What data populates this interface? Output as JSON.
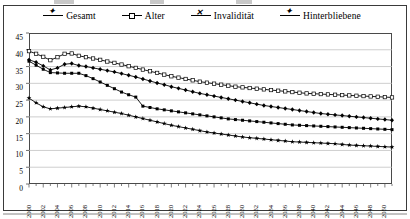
{
  "figure": {
    "frame": true,
    "background": "#ffffff",
    "line_color": "#000000"
  },
  "legend": {
    "position": "top-center",
    "items": [
      {
        "label": "Gesamt",
        "marker": "filled-diamond",
        "marker_class": "star"
      },
      {
        "label": "Alter",
        "marker": "hollow-square",
        "marker_class": "hollow"
      },
      {
        "label": "Invalidität",
        "marker": "filled-square",
        "marker_class": "cross"
      },
      {
        "label": "Hinterbliebene",
        "marker": "filled-star",
        "marker_class": "star"
      }
    ]
  },
  "axes": {
    "y_ticks": [
      "45",
      "40",
      "35",
      "30",
      "25",
      "20",
      "15",
      "10",
      "5",
      "0"
    ],
    "x_tick_step_years": 2,
    "grid": "horizontal"
  },
  "chart_data": {
    "type": "line",
    "title": "",
    "xlabel": "",
    "ylabel": "",
    "ylim": [
      0,
      45
    ],
    "xlim": [
      2000,
      2051
    ],
    "grid": true,
    "legend_position": "top-center",
    "x": [
      2000,
      2001,
      2002,
      2003,
      2004,
      2005,
      2006,
      2007,
      2008,
      2009,
      2010,
      2011,
      2012,
      2013,
      2014,
      2015,
      2016,
      2017,
      2018,
      2019,
      2020,
      2021,
      2022,
      2023,
      2024,
      2025,
      2026,
      2027,
      2028,
      2029,
      2030,
      2031,
      2032,
      2033,
      2034,
      2035,
      2036,
      2037,
      2038,
      2039,
      2040,
      2041,
      2042,
      2043,
      2044,
      2045,
      2046,
      2047,
      2048,
      2049,
      2050,
      2051
    ],
    "x_tick_labels": [
      "2000",
      "2002",
      "2004",
      "2006",
      "2008",
      "2010",
      "2012",
      "2014",
      "2016",
      "2018",
      "2020",
      "2022",
      "2024",
      "2026",
      "2028",
      "2030",
      "2032",
      "2034",
      "2036",
      "2038",
      "2040",
      "2042",
      "2044",
      "2046",
      "2048",
      "2050"
    ],
    "series": [
      {
        "name": "Gesamt",
        "marker": "filled-diamond",
        "values": [
          37.0,
          36.3,
          35.2,
          34.0,
          34.6,
          35.7,
          35.9,
          35.3,
          35.0,
          34.6,
          34.2,
          33.8,
          33.4,
          32.9,
          32.4,
          31.9,
          31.3,
          30.7,
          30.1,
          29.6,
          29.0,
          28.5,
          28.0,
          27.5,
          27.0,
          26.6,
          26.2,
          25.8,
          25.4,
          25.0,
          24.6,
          24.2,
          23.8,
          23.4,
          23.1,
          22.8,
          22.5,
          22.2,
          21.9,
          21.6,
          21.3,
          21.0,
          20.8,
          20.6,
          20.4,
          20.2,
          20.0,
          19.8,
          19.6,
          19.4,
          19.2,
          19.0
        ]
      },
      {
        "name": "Alter",
        "marker": "hollow-square",
        "values": [
          39.6,
          38.8,
          37.9,
          36.9,
          37.8,
          38.8,
          38.9,
          38.2,
          37.8,
          37.4,
          37.0,
          36.5,
          36.1,
          35.6,
          35.1,
          34.6,
          34.1,
          33.6,
          33.1,
          32.6,
          32.1,
          31.7,
          31.3,
          30.9,
          30.5,
          30.2,
          29.9,
          29.6,
          29.3,
          29.0,
          28.8,
          28.6,
          28.4,
          28.2,
          28.0,
          27.8,
          27.6,
          27.4,
          27.2,
          27.0,
          26.9,
          26.8,
          26.7,
          26.6,
          26.5,
          26.4,
          26.3,
          26.2,
          26.1,
          26.0,
          25.9,
          25.8
        ]
      },
      {
        "name": "Invalidität",
        "marker": "filled-square",
        "values": [
          36.6,
          35.4,
          34.2,
          33.2,
          33.1,
          33.0,
          33.0,
          33.0,
          32.3,
          31.4,
          30.4,
          29.4,
          28.4,
          27.4,
          26.6,
          25.9,
          23.2,
          22.8,
          22.4,
          22.1,
          21.8,
          21.5,
          21.2,
          20.9,
          20.6,
          20.3,
          20.0,
          19.7,
          19.4,
          19.2,
          19.0,
          18.8,
          18.6,
          18.4,
          18.2,
          18.0,
          17.8,
          17.6,
          17.5,
          17.4,
          17.3,
          17.2,
          17.1,
          17.0,
          16.9,
          16.8,
          16.7,
          16.6,
          16.5,
          16.4,
          16.3,
          16.2
        ]
      },
      {
        "name": "Hinterbliebene",
        "marker": "filled-star",
        "values": [
          25.6,
          24.2,
          23.0,
          22.4,
          22.6,
          22.8,
          23.0,
          23.2,
          23.0,
          22.6,
          22.2,
          21.8,
          21.4,
          21.0,
          20.5,
          20.0,
          19.5,
          19.0,
          18.5,
          18.0,
          17.5,
          17.1,
          16.7,
          16.3,
          15.9,
          15.5,
          15.2,
          14.9,
          14.6,
          14.3,
          14.0,
          13.8,
          13.6,
          13.4,
          13.2,
          13.0,
          12.8,
          12.6,
          12.5,
          12.4,
          12.3,
          12.2,
          12.1,
          12.0,
          11.8,
          11.6,
          11.5,
          11.4,
          11.3,
          11.2,
          11.1,
          11.0
        ]
      }
    ]
  }
}
